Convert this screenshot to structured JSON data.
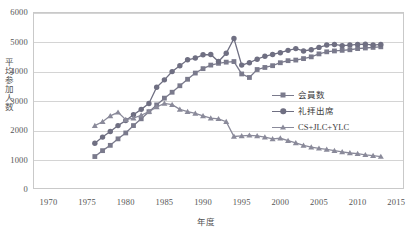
{
  "chart_data": {
    "type": "line",
    "title": "",
    "xlabel": "年度",
    "ylabel": "平均参加人数",
    "xlim": [
      1968,
      2016
    ],
    "ylim": [
      0,
      6000
    ],
    "grid": true,
    "legend_position": "right-middle",
    "xticks": [
      "1970",
      "1975",
      "1980",
      "1985",
      "1990",
      "1995",
      "2000",
      "2005",
      "2010",
      "2015"
    ],
    "xtick_values": [
      1970,
      1975,
      1980,
      1985,
      1990,
      1995,
      2000,
      2005,
      2010,
      2015
    ],
    "yticks": [
      "0",
      "1000",
      "2000",
      "3000",
      "4000",
      "5000",
      "6000"
    ],
    "ytick_values": [
      0,
      1000,
      2000,
      3000,
      4000,
      5000,
      6000
    ],
    "series": [
      {
        "name": "会員数",
        "marker": "square",
        "color": "#7a7a8c",
        "x": [
          1976,
          1977,
          1978,
          1979,
          1980,
          1981,
          1982,
          1983,
          1984,
          1985,
          1986,
          1987,
          1988,
          1989,
          1990,
          1991,
          1992,
          1993,
          1994,
          1995,
          1996,
          1997,
          1998,
          1999,
          2000,
          2001,
          2002,
          2003,
          2004,
          2005,
          2006,
          2007,
          2008,
          2009,
          2010,
          2011,
          2012,
          2013
        ],
        "values": [
          1100,
          1300,
          1480,
          1700,
          1900,
          2150,
          2380,
          2620,
          2850,
          3080,
          3280,
          3500,
          3720,
          3930,
          4080,
          4200,
          4260,
          4300,
          4320,
          3900,
          3780,
          4050,
          4120,
          4180,
          4280,
          4350,
          4370,
          4420,
          4480,
          4580,
          4650,
          4680,
          4700,
          4720,
          4760,
          4780,
          4800,
          4820
        ]
      },
      {
        "name": "礼拝出席",
        "marker": "circle",
        "color": "#6f6f82",
        "x": [
          1976,
          1977,
          1978,
          1979,
          1980,
          1981,
          1982,
          1983,
          1984,
          1985,
          1986,
          1987,
          1988,
          1989,
          1990,
          1991,
          1992,
          1993,
          1994,
          1995,
          1996,
          1997,
          1998,
          1999,
          2000,
          2001,
          2002,
          2003,
          2004,
          2005,
          2006,
          2007,
          2008,
          2009,
          2010,
          2011,
          2012,
          2013
        ],
        "values": [
          1550,
          1760,
          1950,
          2150,
          2320,
          2520,
          2700,
          2900,
          3450,
          3700,
          3980,
          4180,
          4380,
          4440,
          4550,
          4560,
          4320,
          4600,
          5100,
          4200,
          4280,
          4400,
          4500,
          4560,
          4620,
          4700,
          4760,
          4680,
          4720,
          4800,
          4880,
          4900,
          4860,
          4880,
          4900,
          4910,
          4880,
          4900
        ]
      },
      {
        "name": "CS+JLC+YLC",
        "marker": "triangle",
        "color": "#8a8a9a",
        "x": [
          1976,
          1977,
          1978,
          1979,
          1980,
          1981,
          1982,
          1983,
          1984,
          1985,
          1986,
          1987,
          1988,
          1989,
          1990,
          1991,
          1992,
          1993,
          1994,
          1995,
          1996,
          1997,
          1998,
          1999,
          2000,
          2001,
          2002,
          2003,
          2004,
          2005,
          2006,
          2007,
          2008,
          2009,
          2010,
          2011,
          2012,
          2013
        ],
        "values": [
          2150,
          2280,
          2480,
          2600,
          2350,
          2400,
          2500,
          2620,
          2780,
          2900,
          2860,
          2700,
          2620,
          2560,
          2480,
          2400,
          2380,
          2280,
          1780,
          1800,
          1820,
          1800,
          1760,
          1700,
          1720,
          1640,
          1560,
          1480,
          1420,
          1380,
          1340,
          1300,
          1260,
          1220,
          1200,
          1160,
          1130,
          1100
        ]
      }
    ]
  },
  "legend": {
    "items": [
      {
        "label": "会員数",
        "marker": "square"
      },
      {
        "label": "礼拝出席",
        "marker": "circle"
      },
      {
        "label": "CS+JLC+YLC",
        "marker": "triangle"
      }
    ]
  }
}
